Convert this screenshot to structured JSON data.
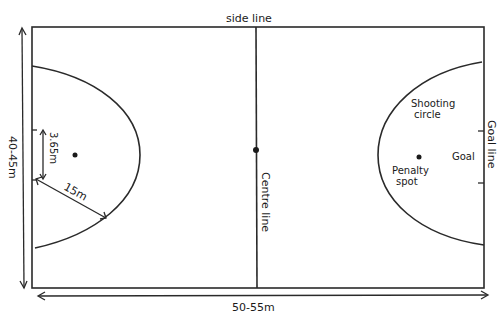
{
  "diagram": {
    "type": "netball court layout",
    "labels": {
      "side_line": "side line",
      "centre_line": "Centre line",
      "goal_line": "Goal line",
      "shooting_circle_line1": "Shooting",
      "shooting_circle_line2": "circle",
      "penalty_spot_line1": "Penalty",
      "penalty_spot_line2": "spot",
      "goal": "Goal"
    },
    "dimensions": {
      "width": "40-45m",
      "length": "50-55m",
      "circle_radius": "15m",
      "goal_offset": "3.65m"
    },
    "colors": {
      "line": "#2a2a2a",
      "background": "#ffffff"
    }
  }
}
